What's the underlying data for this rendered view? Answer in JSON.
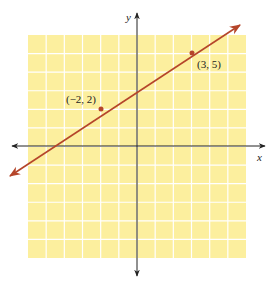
{
  "chart_data": {
    "type": "line",
    "title": "",
    "xlabel": "x",
    "ylabel": "y",
    "xlim": [
      -6,
      6
    ],
    "ylim": [
      -6,
      6
    ],
    "grid": true,
    "series": [
      {
        "name": "line through (-2, 2) and (3, 5)",
        "equation": "y = 0.6x + 3.2",
        "points": [
          {
            "x": -2,
            "y": 2,
            "label": "(−2, 2)"
          },
          {
            "x": 3,
            "y": 5,
            "label": "(3, 5)"
          }
        ],
        "color": "#b5452a"
      }
    ]
  },
  "labels": {
    "x_axis": "x",
    "y_axis": "y",
    "point1": "(−2, 2)",
    "point2": "(3, 5)"
  },
  "colors": {
    "grid_fill": "#fcef9e",
    "grid_lines": "#ffffff",
    "line": "#b5452a",
    "axes": "#222222"
  }
}
